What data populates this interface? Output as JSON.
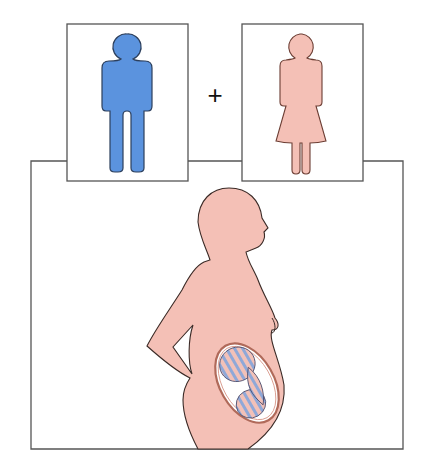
{
  "diagram": {
    "title": "",
    "operator_symbol": "+",
    "panels": [
      {
        "id": "male",
        "figure": "man-icon",
        "color": "#5b93de"
      },
      {
        "id": "female",
        "figure": "woman-icon",
        "color": "#f4c0b6"
      }
    ],
    "result": {
      "figure": "pregnant-woman-silhouette",
      "color": "#f4c0b6",
      "fetus_stripe_colors": [
        "#8fa8d8",
        "#f2c1b8"
      ]
    },
    "colors": {
      "outline": "#3a3a3a",
      "frame": "#555555",
      "background": "#ffffff"
    }
  }
}
